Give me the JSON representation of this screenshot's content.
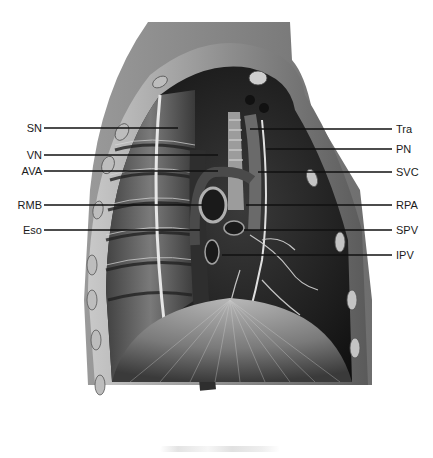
{
  "figure": {
    "labels_left": [
      {
        "text": "SN",
        "y": 128
      },
      {
        "text": "VN",
        "y": 155
      },
      {
        "text": "AVA",
        "y": 171
      },
      {
        "text": "RMB",
        "y": 205
      },
      {
        "text": "Eso",
        "y": 230
      }
    ],
    "labels_right": [
      {
        "text": "Tra",
        "y": 129
      },
      {
        "text": "PN",
        "y": 149
      },
      {
        "text": "SVC",
        "y": 172
      },
      {
        "text": "RPA",
        "y": 205
      },
      {
        "text": "SPV",
        "y": 230
      },
      {
        "text": "IPV",
        "y": 255
      }
    ]
  },
  "colors": {
    "background": "#ffffff",
    "label_text": "#1a1a1a",
    "leader_line": "#111111"
  }
}
